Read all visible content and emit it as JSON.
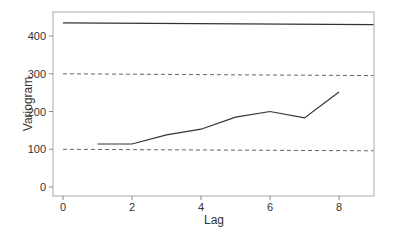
{
  "chart_data": {
    "type": "line",
    "title": "",
    "xlabel": "Lag",
    "ylabel": "Variogram",
    "xlim": [
      -0.4,
      9.4
    ],
    "ylim": [
      -20,
      460
    ],
    "xticks": [
      0,
      2,
      4,
      6,
      8
    ],
    "yticks": [
      0,
      100,
      200,
      300,
      400
    ],
    "grid": false,
    "legend": "none",
    "series": [
      {
        "name": "empirical variogram",
        "style": "solid",
        "x": [
          1,
          2,
          3,
          4,
          5,
          6,
          7,
          8
        ],
        "y": [
          114,
          114,
          138,
          153,
          185,
          200,
          183,
          252
        ]
      },
      {
        "name": "sill",
        "style": "solid",
        "x": [
          0,
          9
        ],
        "y": [
          435,
          430
        ]
      },
      {
        "name": "upper envelope",
        "style": "dashed",
        "x": [
          0,
          9
        ],
        "y": [
          300,
          295
        ]
      },
      {
        "name": "lower envelope",
        "style": "dashed",
        "x": [
          0,
          9
        ],
        "y": [
          100,
          96
        ]
      }
    ],
    "colors": {
      "line": "#333333",
      "dashed": "#555555",
      "axis": "#888888",
      "text": "#333333"
    }
  }
}
